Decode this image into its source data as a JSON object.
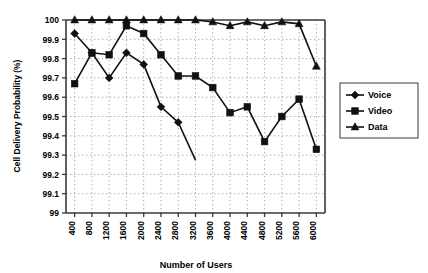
{
  "chart_data": {
    "type": "line",
    "title": "",
    "xlabel": "Number of Users",
    "ylabel": "Cell Delivery Probability (%)",
    "categories": [
      "400",
      "800",
      "1200",
      "1600",
      "2000",
      "2400",
      "2800",
      "3200",
      "3600",
      "4000",
      "4400",
      "4800",
      "5200",
      "5600",
      "6000"
    ],
    "ylim": [
      99,
      100
    ],
    "yticks": [
      "99",
      "99.1",
      "99.2",
      "99.3",
      "99.4",
      "99.5",
      "99.6",
      "99.7",
      "99.8",
      "99.9",
      "100"
    ],
    "grid": true,
    "legend_position": "right",
    "series": [
      {
        "name": "Voice",
        "marker": "diamond",
        "values": [
          99.93,
          99.83,
          99.7,
          99.83,
          99.77,
          99.55,
          99.47,
          null,
          null,
          null,
          null,
          null,
          null,
          null,
          null
        ],
        "note": "line descends below axis minimum between 2800 and 3200"
      },
      {
        "name": "Video",
        "marker": "square",
        "values": [
          99.67,
          99.83,
          99.82,
          99.97,
          99.93,
          99.82,
          99.71,
          99.71,
          99.65,
          99.52,
          99.55,
          99.37,
          99.5,
          99.59,
          99.33
        ]
      },
      {
        "name": "Data",
        "marker": "triangle",
        "values": [
          100.0,
          100.0,
          100.0,
          100.0,
          100.0,
          100.0,
          100.0,
          100.0,
          99.99,
          99.97,
          99.99,
          99.97,
          99.99,
          99.98,
          99.76
        ]
      }
    ]
  },
  "legend": {
    "items": [
      {
        "label": "Voice",
        "marker": "diamond"
      },
      {
        "label": "Video",
        "marker": "square"
      },
      {
        "label": "Data",
        "marker": "triangle"
      }
    ]
  },
  "colors": {
    "ink": "#111111",
    "axis": "#3a3a3a",
    "grid": "#8a8a8a",
    "background": "#ffffff"
  }
}
